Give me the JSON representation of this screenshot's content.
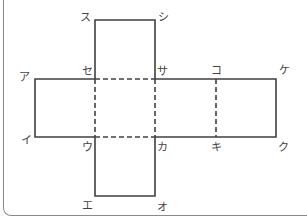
{
  "diagram": {
    "type": "cube-net",
    "colors": {
      "line": "#404040",
      "frame": "#8a8a8a",
      "text": "#444444"
    },
    "vertices": [
      {
        "id": "su",
        "label": "ス",
        "x": 85,
        "y": 17
      },
      {
        "id": "shi",
        "label": "シ",
        "x": 163,
        "y": 17
      },
      {
        "id": "a",
        "label": "ア",
        "x": 24,
        "y": 77
      },
      {
        "id": "se",
        "label": "セ",
        "x": 87,
        "y": 71
      },
      {
        "id": "sa",
        "label": "サ",
        "x": 162,
        "y": 71
      },
      {
        "id": "ko",
        "label": "コ",
        "x": 216,
        "y": 70
      },
      {
        "id": "ke",
        "label": "ケ",
        "x": 284,
        "y": 70
      },
      {
        "id": "i",
        "label": "イ",
        "x": 26,
        "y": 140
      },
      {
        "id": "u",
        "label": "ウ",
        "x": 87,
        "y": 147
      },
      {
        "id": "ka",
        "label": "カ",
        "x": 162,
        "y": 147
      },
      {
        "id": "ki",
        "label": "キ",
        "x": 216,
        "y": 147
      },
      {
        "id": "ku",
        "label": "ク",
        "x": 283,
        "y": 147
      },
      {
        "id": "e",
        "label": "エ",
        "x": 87,
        "y": 205
      },
      {
        "id": "o",
        "label": "オ",
        "x": 162,
        "y": 207
      }
    ]
  }
}
